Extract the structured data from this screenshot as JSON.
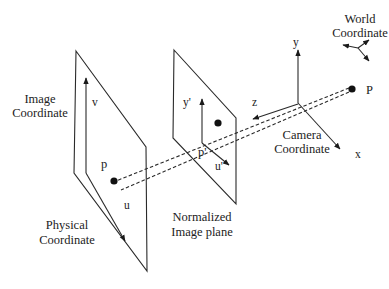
{
  "diagram": {
    "type": "camera-projection-model",
    "colors": {
      "stroke": "#2a2a2a",
      "text": "#222222",
      "background": "#ffffff"
    },
    "labels": {
      "world_coordinate_line1": "World",
      "world_coordinate_line2": "Coordinate",
      "image_coordinate_line1": "Image",
      "image_coordinate_line2": "Coordinate",
      "physical_coordinate_line1": "Physical",
      "physical_coordinate_line2": "Coordinate",
      "normalized_plane_line1": "Normalized",
      "normalized_plane_line2": "Image plane",
      "camera_coordinate_line1": "Camera",
      "camera_coordinate_line2": "Coordinate"
    },
    "axes": {
      "v": "v",
      "u": "u",
      "y_prime": "y'",
      "u_prime": "u'",
      "camera_y": "y",
      "camera_x": "x",
      "camera_z": "z"
    },
    "points": {
      "image_point": "p",
      "normalized_point": "p'",
      "world_point": "P"
    }
  }
}
